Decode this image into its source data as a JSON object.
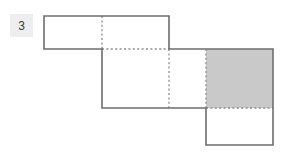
{
  "figure": {
    "label": "3",
    "label_badge_bg": "#eeeeee",
    "outline_color": "#6e6e6e",
    "fold_line_color": "#8a8a8a",
    "shaded_face_color": "#c9c9c9",
    "unshaded_face_color": "#ffffff",
    "background_color": "#ffffff",
    "grid": {
      "columns_px": [
        44,
        102,
        169,
        206,
        273
      ],
      "rows_px": [
        16,
        49,
        108,
        145
      ]
    },
    "faces": [
      {
        "name": "top-left-face-a",
        "x": 44,
        "y": 16,
        "w": 58,
        "h": 33,
        "shaded": false
      },
      {
        "name": "top-left-face-b",
        "x": 102,
        "y": 16,
        "w": 67,
        "h": 33,
        "shaded": false
      },
      {
        "name": "middle-face-a",
        "x": 102,
        "y": 49,
        "w": 67,
        "h": 59,
        "shaded": false
      },
      {
        "name": "middle-face-b",
        "x": 169,
        "y": 49,
        "w": 37,
        "h": 59,
        "shaded": false
      },
      {
        "name": "middle-face-c",
        "x": 206,
        "y": 49,
        "w": 67,
        "h": 59,
        "shaded": true
      },
      {
        "name": "bottom-face",
        "x": 206,
        "y": 108,
        "w": 67,
        "h": 37,
        "shaded": false
      }
    ],
    "outline_path": "M44,16 L169,16 L169,49 L273,49 L273,145 L206,145 L206,108 L102,108 L102,49 L44,49 Z",
    "fold_lines": [
      {
        "name": "fold-vertical-top",
        "x1": 102,
        "y1": 16,
        "x2": 102,
        "y2": 49
      },
      {
        "name": "fold-horizontal-top",
        "x1": 102,
        "y1": 49,
        "x2": 169,
        "y2": 49
      },
      {
        "name": "fold-vertical-mid-a",
        "x1": 169,
        "y1": 49,
        "x2": 169,
        "y2": 108
      },
      {
        "name": "fold-vertical-mid-b",
        "x1": 206,
        "y1": 49,
        "x2": 206,
        "y2": 108
      },
      {
        "name": "fold-horizontal-bot",
        "x1": 206,
        "y1": 108,
        "x2": 273,
        "y2": 108
      }
    ]
  }
}
